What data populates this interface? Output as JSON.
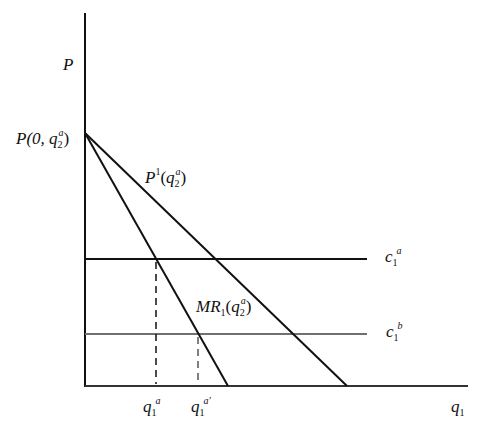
{
  "diagram": {
    "type": "economics-monopoly-diagram",
    "axes": {
      "y_label": "P",
      "x_label": {
        "base": "q",
        "sub": "1"
      }
    },
    "curves": [
      {
        "id": "demand",
        "label": {
          "base": "P",
          "sup": "1",
          "arg_base": "q",
          "arg_sub": "2",
          "arg_sup": "a"
        },
        "color": "#111111"
      },
      {
        "id": "marginal-revenue",
        "label": {
          "base": "MR",
          "sub": "1",
          "arg_base": "q",
          "arg_sub": "2",
          "arg_sup": "a"
        },
        "color": "#111111"
      },
      {
        "id": "cost-a",
        "label": {
          "base": "c",
          "sub": "1",
          "sup": "a"
        },
        "color": "#111111"
      },
      {
        "id": "cost-b",
        "label": {
          "base": "c",
          "sub": "1",
          "sup": "b"
        },
        "color": "#707070"
      }
    ],
    "intercept_label": {
      "prefix": "P(0, ",
      "base": "q",
      "sub": "2",
      "sup": "a",
      "suffix": ")"
    },
    "x_markers": [
      {
        "base": "q",
        "sub": "1",
        "sup": "a"
      },
      {
        "base": "q",
        "sub": "1",
        "sup": "a'"
      }
    ]
  },
  "text": {
    "y_axis": "P",
    "x_axis_base": "q",
    "x_axis_sub": "1",
    "intercept_prefix": "P(0, ",
    "intercept_q": "q",
    "intercept_sub": "2",
    "intercept_sup": "a",
    "intercept_suffix": ")",
    "demand_base": "P",
    "demand_sup": "1",
    "demand_open": "(",
    "demand_q": "q",
    "demand_sub": "2",
    "demand_sup2": "a",
    "demand_close": ")",
    "mr_base": "MR",
    "mr_sub": "1",
    "mr_open": "(",
    "mr_q": "q",
    "mr_sub2": "2",
    "mr_sup": "a",
    "mr_close": ")",
    "ca_base": "c",
    "ca_sub": "1",
    "ca_sup": "a",
    "cb_base": "c",
    "cb_sub": "1",
    "cb_sup": "b",
    "qa_base": "q",
    "qa_sub": "1",
    "qa_sup": "a",
    "qap_base": "q",
    "qap_sub": "1",
    "qap_sup": "a'"
  }
}
